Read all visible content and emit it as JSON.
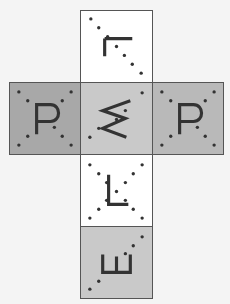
{
  "diagram": {
    "type": "cube-net",
    "faces": [
      {
        "id": "top",
        "x": 80,
        "y": 10,
        "w": 72,
        "h": 72,
        "fill": "#ffffff",
        "glyph": "L (upside-down)",
        "glyph_path": "M24,28 L52,28 M24,28 L24,46",
        "dots": [
          [
            10,
            8
          ],
          [
            18,
            17
          ],
          [
            27,
            26
          ],
          [
            36,
            36
          ],
          [
            44,
            45
          ],
          [
            52,
            54
          ],
          [
            61,
            63
          ]
        ]
      },
      {
        "id": "left",
        "x": 9,
        "y": 82,
        "w": 71,
        "h": 72,
        "fill": "#a8a8a8",
        "glyph": "P",
        "glyph_path": "M27,52 L27,22 L41,22 C52,22 52,39 41,39 L27,39",
        "dots": [
          [
            9,
            9
          ],
          [
            62,
            9
          ],
          [
            18,
            18
          ],
          [
            53,
            18
          ],
          [
            45,
            45
          ],
          [
            18,
            54
          ],
          [
            53,
            54
          ],
          [
            9,
            63
          ],
          [
            62,
            63
          ]
        ]
      },
      {
        "id": "center",
        "x": 80,
        "y": 82,
        "w": 72,
        "h": 72,
        "fill": "#c9c9c9",
        "glyph": "W (rotated)",
        "glyph_path": "M50,18 L22,28 L45,36 L22,46 L46,55",
        "dots": [
          [
            62,
            10
          ],
          [
            45,
            28
          ],
          [
            36,
            37
          ],
          [
            18,
            46
          ],
          [
            9,
            55
          ]
        ]
      },
      {
        "id": "right",
        "x": 152,
        "y": 82,
        "w": 71,
        "h": 72,
        "fill": "#b9b9b9",
        "glyph": "P",
        "glyph_path": "M27,52 L27,22 L41,22 C52,22 52,39 41,39 L27,39",
        "dots": [
          [
            9,
            9
          ],
          [
            62,
            9
          ],
          [
            18,
            18
          ],
          [
            53,
            18
          ],
          [
            45,
            45
          ],
          [
            18,
            54
          ],
          [
            53,
            54
          ],
          [
            9,
            63
          ],
          [
            62,
            63
          ]
        ]
      },
      {
        "id": "lower",
        "x": 80,
        "y": 154,
        "w": 72,
        "h": 72,
        "fill": "#ffffff",
        "glyph": "L",
        "glyph_path": "M28,20 L28,50 L48,50",
        "dots": [
          [
            9,
            10
          ],
          [
            62,
            10
          ],
          [
            18,
            19
          ],
          [
            53,
            19
          ],
          [
            26,
            28
          ],
          [
            45,
            28
          ],
          [
            36,
            37
          ],
          [
            26,
            46
          ],
          [
            45,
            46
          ],
          [
            18,
            55
          ],
          [
            53,
            55
          ],
          [
            9,
            64
          ],
          [
            62,
            64
          ]
        ]
      },
      {
        "id": "bottom",
        "x": 80,
        "y": 226,
        "w": 72,
        "h": 72,
        "fill": "#c9c9c9",
        "glyph": "E (rotated)",
        "glyph_path": "M22,28 L22,46 L50,46 L50,28 M36,46 L36,30",
        "dots": [
          [
            62,
            10
          ],
          [
            53,
            19
          ],
          [
            45,
            27
          ],
          [
            18,
            55
          ],
          [
            9,
            63
          ]
        ]
      }
    ],
    "colors": {
      "border": "#555555",
      "glyph": "#333333",
      "dot": "#333333",
      "background": "#f4f4f4"
    }
  }
}
